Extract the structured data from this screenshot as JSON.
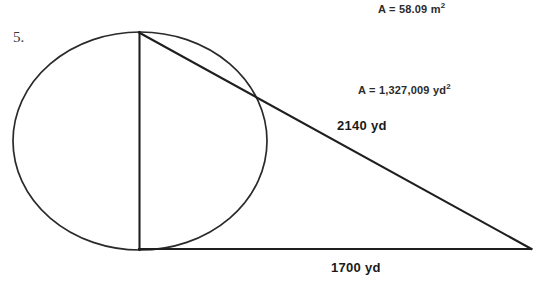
{
  "problem": {
    "number": "5.",
    "figure_caption": ""
  },
  "annotations": {
    "area_metric": {
      "prefix": "A = ",
      "value": "58.09",
      "unit": "m",
      "exponent": "2",
      "full_text": "A = 58.09 m²"
    },
    "area_yards": {
      "prefix": "A = ",
      "value": "1,327,009",
      "unit": "yd",
      "exponent": "2",
      "full_text": "A = 1,327,009 yd²"
    }
  },
  "dimensions": {
    "hypotenuse": {
      "value": "2140",
      "unit": "yd",
      "full_text": "2140 yd"
    },
    "base": {
      "value": "1700",
      "unit": "yd",
      "full_text": "1700 yd"
    }
  },
  "style": {
    "ink": "#1c1c1c",
    "stroke": "#2a2a2a",
    "background": "#ffffff"
  },
  "geometry": {
    "circle": {
      "cx": 140,
      "cy": 141,
      "rx": 127,
      "ry": 109
    },
    "diameter_line": {
      "x1": 139,
      "y1": 32,
      "x2": 139,
      "y2": 249
    },
    "triangle": {
      "apex": {
        "x": 139,
        "y": 32
      },
      "right_angle": {
        "x": 139,
        "y": 249
      },
      "far_vertex": {
        "x": 531,
        "y": 249
      }
    }
  }
}
